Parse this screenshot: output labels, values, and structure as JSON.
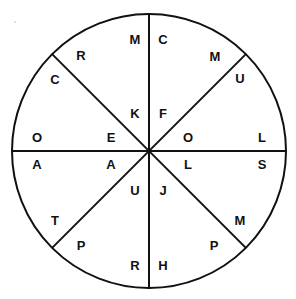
{
  "figure": {
    "type": "circle-diagram",
    "title": "",
    "background_color": "#ffffff",
    "stroke_color": "#111111",
    "text_color": "#111111",
    "circle": {
      "center_x": 149,
      "center_y": 151,
      "radius": 137
    },
    "dividers": [
      {
        "name": "vertical-diameter",
        "angle_deg": 90
      },
      {
        "name": "horizontal-diameter",
        "angle_deg": 0
      },
      {
        "name": "diagonal-nw-se",
        "angle_deg": 135
      },
      {
        "name": "diagonal-ne-sw",
        "angle_deg": 45
      }
    ],
    "labels": [
      {
        "id": "top-left",
        "text": "M",
        "x": 135,
        "y": 39
      },
      {
        "id": "top-right",
        "text": "C",
        "x": 163,
        "y": 39
      },
      {
        "id": "upper-left-outer",
        "text": "R",
        "x": 81,
        "y": 55
      },
      {
        "id": "upper-left-rim",
        "text": "C",
        "x": 55,
        "y": 79
      },
      {
        "id": "upper-right-outer",
        "text": "M",
        "x": 215,
        "y": 56
      },
      {
        "id": "upper-right-rim",
        "text": "U",
        "x": 240,
        "y": 78
      },
      {
        "id": "inner-upper-left",
        "text": "K",
        "x": 135,
        "y": 113
      },
      {
        "id": "inner-upper-right",
        "text": "F",
        "x": 163,
        "y": 113
      },
      {
        "id": "left-upper-mid",
        "text": "E",
        "x": 111,
        "y": 137
      },
      {
        "id": "right-upper-mid",
        "text": "O",
        "x": 188,
        "y": 137
      },
      {
        "id": "left-rim-upper",
        "text": "O",
        "x": 37,
        "y": 137
      },
      {
        "id": "right-rim-upper",
        "text": "L",
        "x": 262,
        "y": 137
      },
      {
        "id": "left-rim-lower",
        "text": "A",
        "x": 37,
        "y": 164
      },
      {
        "id": "left-lower-mid",
        "text": "A",
        "x": 111,
        "y": 164
      },
      {
        "id": "right-lower-mid",
        "text": "L",
        "x": 188,
        "y": 164
      },
      {
        "id": "right-rim-lower",
        "text": "S",
        "x": 262,
        "y": 164
      },
      {
        "id": "inner-lower-left",
        "text": "U",
        "x": 135,
        "y": 190
      },
      {
        "id": "inner-lower-right",
        "text": "J",
        "x": 163,
        "y": 190
      },
      {
        "id": "lower-left-rim",
        "text": "T",
        "x": 55,
        "y": 220
      },
      {
        "id": "lower-left-outer",
        "text": "P",
        "x": 81,
        "y": 245
      },
      {
        "id": "lower-right-rim",
        "text": "M",
        "x": 240,
        "y": 220
      },
      {
        "id": "lower-right-outer",
        "text": "P",
        "x": 214,
        "y": 245
      },
      {
        "id": "bottom-left",
        "text": "R",
        "x": 135,
        "y": 265
      },
      {
        "id": "bottom-right",
        "text": "H",
        "x": 163,
        "y": 265
      }
    ]
  }
}
